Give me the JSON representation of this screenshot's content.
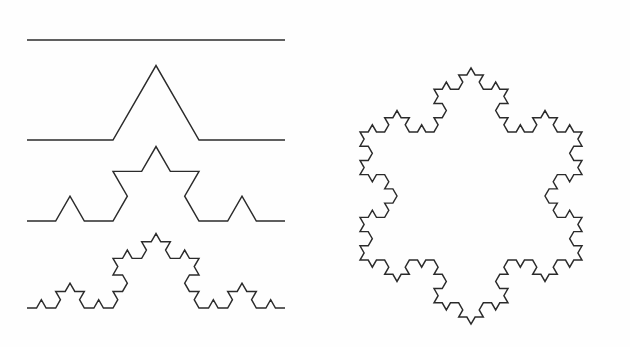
{
  "figure": {
    "background_color": "#fefefe",
    "stroke_color": "#2b2b2b",
    "stroke_width": 1.45,
    "width": 630,
    "height": 347
  },
  "chart_data": {
    "type": "line",
    "xlabel": "",
    "ylabel": "",
    "grid": false,
    "legend": null,
    "xlim": [
      0,
      630
    ],
    "ylim": [
      0,
      347
    ],
    "series": [
      {
        "name": "koch-stage-0",
        "label": "Initiator (straight segment, 0 iterations)",
        "iteration": 0,
        "segment_count": 1,
        "baseline_y": 40,
        "x_start": 27,
        "x_end": 285,
        "span": 258
      },
      {
        "name": "koch-stage-1",
        "label": "Generator (1 iteration)",
        "iteration": 1,
        "segment_count": 4,
        "baseline_y": 140,
        "x_start": 27,
        "x_end": 285,
        "span": 258,
        "peak_x": 156,
        "peak_y": 62
      },
      {
        "name": "koch-stage-2",
        "label": "2 iterations",
        "iteration": 2,
        "segment_count": 16,
        "baseline_y": 221,
        "x_start": 27,
        "x_end": 285,
        "span": 258,
        "peak_x": 156,
        "peak_y": 152
      },
      {
        "name": "koch-stage-3",
        "label": "3 iterations",
        "iteration": 3,
        "segment_count": 64,
        "baseline_y": 308,
        "x_start": 27,
        "x_end": 285,
        "span": 258,
        "peak_x": 156,
        "peak_y": 239
      },
      {
        "name": "koch-snowflake",
        "label": "Koch snowflake (3 iterations on an equilateral triangle)",
        "iteration": 3,
        "segment_count": 192,
        "center_x": 471,
        "center_y": 196,
        "triangle_side": 222,
        "top_peak_x": 471,
        "top_peak_y": 29,
        "bottom_peak_x": 471,
        "bottom_peak_y": 325,
        "left_extreme_x": 343,
        "right_extreme_x": 600
      }
    ]
  },
  "panels": {
    "left_panel_name": "koch-curve-stages",
    "right_panel_name": "koch-snowflake"
  }
}
